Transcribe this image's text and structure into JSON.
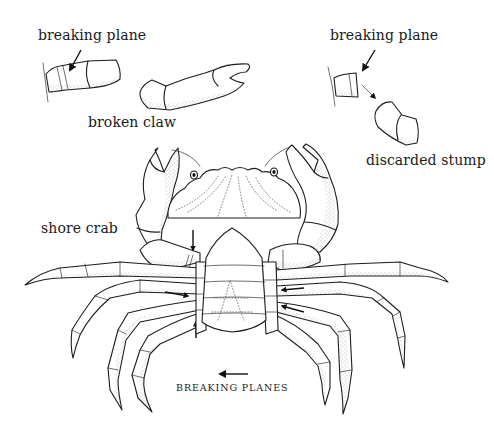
{
  "figure": {
    "labels": {
      "breaking_plane_left": "breaking plane",
      "broken_claw": "broken claw",
      "breaking_plane_right": "breaking plane",
      "discarded_stump": "discarded stump",
      "shore_crab": "shore crab",
      "breaking_planes_caption": "BREAKING PLANES"
    },
    "panels": [
      {
        "id": "leg-base-detail",
        "description": "leg base with breaking plane indicated by arrow"
      },
      {
        "id": "broken-claw",
        "description": "detached claw"
      },
      {
        "id": "stump-detail",
        "description": "leg base with discarded stump separating"
      },
      {
        "id": "shore-crab-ventral",
        "description": "ventral view of shore crab with arrows at breaking planes of each leg"
      }
    ],
    "colors": {
      "ink": "#1c1c1c",
      "background": "#ffffff",
      "stipple": "#6a6a6a"
    }
  }
}
